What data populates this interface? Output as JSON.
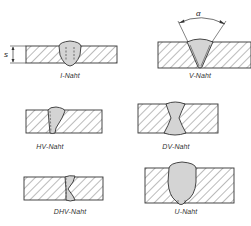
{
  "diagram": {
    "colors": {
      "line": "#333333",
      "hatch": "#555555",
      "weld_fill": "#d4d4d4",
      "background": "#ffffff"
    },
    "seams": [
      {
        "id": "i",
        "label": "I-Naht"
      },
      {
        "id": "v",
        "label": "V-Naht"
      },
      {
        "id": "hv",
        "label": "HV-Naht"
      },
      {
        "id": "dv",
        "label": "DV-Naht"
      },
      {
        "id": "dhv",
        "label": "DHV-Naht"
      },
      {
        "id": "u",
        "label": "U-Naht"
      }
    ],
    "annotations": {
      "thickness_symbol": "s",
      "angle_symbol": "α"
    }
  }
}
